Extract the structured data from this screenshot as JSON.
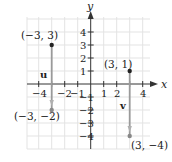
{
  "figure": {
    "axes": {
      "x_label": "x",
      "y_label": "y",
      "x_ticks": [
        "−4",
        "−2",
        "−1",
        "1",
        "2",
        "4"
      ],
      "y_ticks": [
        "4",
        "3",
        "2",
        "1",
        "−1",
        "−2",
        "−3",
        "−4"
      ]
    },
    "points": [
      {
        "label": "(−3, 3)",
        "x": -3,
        "y": 3,
        "color": "#222222"
      },
      {
        "label": "(−3, −2)",
        "x": -3,
        "y": -2,
        "color": "#888888"
      },
      {
        "label": "(3, 1)",
        "x": 3,
        "y": 1,
        "color": "#222222"
      },
      {
        "label": "(3, −4)",
        "x": 3,
        "y": -4,
        "color": "#888888"
      }
    ],
    "vectors": [
      {
        "name": "u",
        "from": [
          -3,
          3
        ],
        "to": [
          -3,
          -2
        ]
      },
      {
        "name": "v",
        "from": [
          3,
          1
        ],
        "to": [
          3,
          -4
        ]
      }
    ],
    "colors": {
      "grid": "#e3e3e3",
      "axis": "#333333",
      "vector": "#9a9a9a"
    }
  }
}
